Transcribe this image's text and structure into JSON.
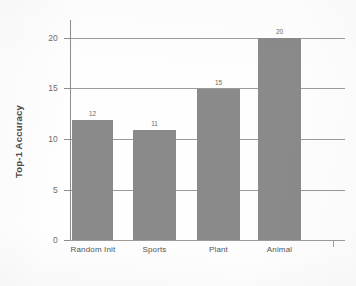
{
  "chart_data": {
    "type": "bar",
    "title": "",
    "xlabel": "",
    "ylabel": "Top-1 Accuracy",
    "categories": [
      "Random Init",
      "Sports",
      "Plant",
      "Animal"
    ],
    "values": [
      12,
      11,
      15,
      20
    ],
    "value_labels": [
      "12",
      "11",
      "15",
      "20"
    ],
    "ylim": [
      0,
      20
    ],
    "ytick_labels": [
      "0",
      "5",
      "10",
      "15",
      "20"
    ],
    "ytick_values": [
      0,
      5,
      10,
      15,
      20
    ],
    "grid": true,
    "legend": "none",
    "bar_color": "#8a8a8a",
    "gridline_color": "#9a9a9a",
    "axis_color": "#8d8d8d",
    "background_color": "#fefefe"
  }
}
